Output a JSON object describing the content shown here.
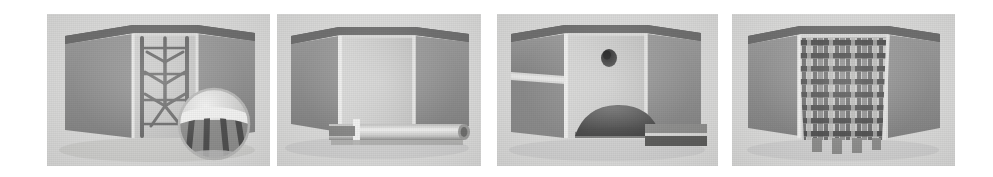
{
  "figure": {
    "background_color": "#ffffff",
    "panel_background_color": "#d9d9d8",
    "panel_count": 4,
    "panels": [
      {
        "index": "1",
        "caption": "",
        "content_name": "branching-tree-network-cross-section",
        "description": "Sectioned block with internal branching tree-like channel network and circular magnified inset at lower right",
        "features": [
          "outer-shell",
          "cutaway-wall",
          "branching-network",
          "magnifier-inset"
        ],
        "colors": {
          "shell": "#8e8e8e",
          "cavity": "#c8c8c7",
          "structure": "#6a6a6a",
          "top_edge": "#5e5e5e"
        }
      },
      {
        "index": "2",
        "caption": "",
        "content_name": "hollow-cavity-with-horizontal-tube",
        "description": "Sectioned block with empty smooth cavity and a horizontal cylindrical tube crossing the lower region",
        "features": [
          "outer-shell",
          "cutaway-wall",
          "empty-cavity",
          "horizontal-cylinder"
        ],
        "colors": {
          "shell": "#8e8e8e",
          "cavity": "#cfcfce",
          "structure": "#9a9a9a",
          "top_edge": "#5e5e5e"
        }
      },
      {
        "index": "3",
        "caption": "",
        "content_name": "cavity-with-port-hole-and-dome",
        "description": "Sectioned block with a small circular port hole in the back wall and a dark dome-shaped deposit on the floor",
        "features": [
          "outer-shell",
          "cutaway-wall",
          "port-hole",
          "dome-deposit",
          "base-bar"
        ],
        "colors": {
          "shell": "#8e8e8e",
          "cavity": "#cfcfce",
          "structure": "#4e4e4e",
          "top_edge": "#5e5e5e"
        }
      },
      {
        "index": "4",
        "caption": "",
        "content_name": "periodic-lattice-core",
        "description": "Sectioned block filled with a dense periodic lattice of vertical columns and cross struts",
        "features": [
          "outer-shell",
          "cutaway-wall",
          "periodic-lattice",
          "lattice-columns"
        ],
        "colors": {
          "shell": "#8e8e8e",
          "cavity": "#c5c5c4",
          "structure": "#585858",
          "top_edge": "#5e5e5e"
        }
      }
    ]
  }
}
